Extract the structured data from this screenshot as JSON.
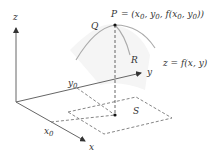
{
  "figure": {
    "axes": {
      "z_label": "z",
      "y_label": "y",
      "x_label": "x",
      "x0_label": "x",
      "x0_sub": "0",
      "y0_label": "y",
      "y0_sub": "0"
    },
    "points": {
      "P_label": "P",
      "P_expression": {
        "prefix": "= (x",
        "s1": "0",
        "mid1": ", y",
        "s2": "0",
        "mid2": ", f(x",
        "s3": "0",
        "mid3": ", y",
        "s4": "0",
        "suffix": "))"
      },
      "Q_label": "Q",
      "R_label": "R",
      "S_label": "S"
    },
    "surface_label": "z = f(x, y)",
    "colors": {
      "axis": "#555555",
      "curve": "#aaaaaa",
      "dashed": "#777777",
      "text": "#333333",
      "surface": "#f3f3f3"
    }
  }
}
